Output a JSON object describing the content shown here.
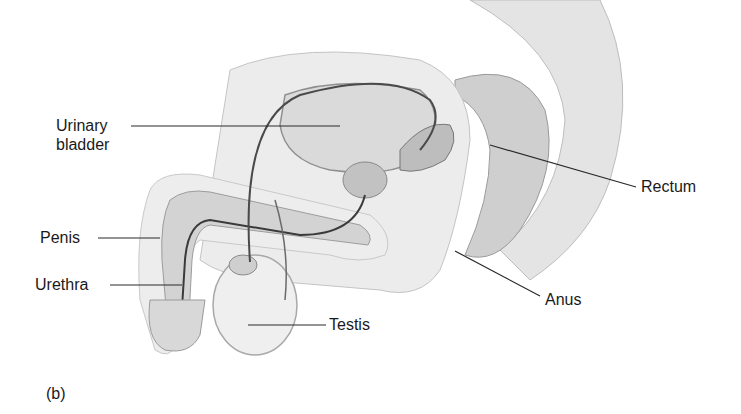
{
  "figure": {
    "panel_label": "(b)",
    "colors": {
      "leader_line": "#2a2a2a",
      "tissue_light": "#e6e6e6",
      "tissue_mid": "#c8c8c8",
      "tissue_dark": "#8a8a8a",
      "duct": "#3a3a3a",
      "background": "#ffffff"
    },
    "labels": [
      {
        "id": "urinary-bladder",
        "text_line1": "Urinary",
        "text_line2": "bladder"
      },
      {
        "id": "penis",
        "text": "Penis"
      },
      {
        "id": "urethra",
        "text": "Urethra"
      },
      {
        "id": "testis",
        "text": "Testis"
      },
      {
        "id": "rectum",
        "text": "Rectum"
      },
      {
        "id": "anus",
        "text": "Anus"
      }
    ]
  }
}
